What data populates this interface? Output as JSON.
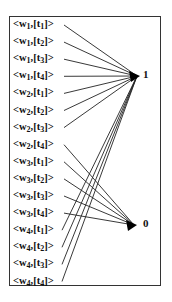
{
  "diagram": {
    "inputs": [
      {
        "w": "1",
        "t": "1",
        "target": "1"
      },
      {
        "w": "1",
        "t": "2",
        "target": "1"
      },
      {
        "w": "1",
        "t": "3",
        "target": "1"
      },
      {
        "w": "1",
        "t": "4",
        "target": "1"
      },
      {
        "w": "2",
        "t": "1",
        "target": "1"
      },
      {
        "w": "2",
        "t": "2",
        "target": "1"
      },
      {
        "w": "2",
        "t": "3",
        "target": "1"
      },
      {
        "w": "2",
        "t": "4",
        "target": "0"
      },
      {
        "w": "3",
        "t": "1",
        "target": "0"
      },
      {
        "w": "3",
        "t": "2",
        "target": "0"
      },
      {
        "w": "3",
        "t": "3",
        "target": "0"
      },
      {
        "w": "3",
        "t": "4",
        "target": "0"
      },
      {
        "w": "4",
        "t": "1",
        "target": "1"
      },
      {
        "w": "4",
        "t": "2",
        "target": "1"
      },
      {
        "w": "4",
        "t": "3",
        "target": "1"
      },
      {
        "w": "4",
        "t": "4",
        "target": "1"
      }
    ],
    "outputs": [
      {
        "id": "1",
        "label": "1",
        "x": 137,
        "y": 76
      },
      {
        "id": "0",
        "label": "0",
        "x": 134,
        "y": 225
      }
    ],
    "line_color": "#222222"
  }
}
